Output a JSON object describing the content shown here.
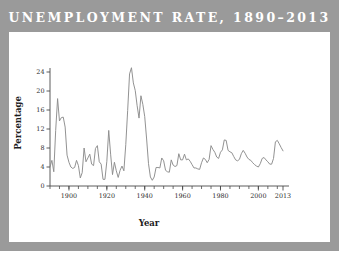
{
  "banner": {
    "title": "UNEMPLOYMENT RATE, 1890–2013",
    "background_color": "#9a9a9a",
    "title_color": "#ffffff"
  },
  "panel": {
    "background_color": "#ffffff"
  },
  "chart_data": {
    "type": "line",
    "title": "",
    "xlabel": "Year",
    "ylabel": "Percentage",
    "xlim": [
      1890,
      2013
    ],
    "ylim": [
      0,
      24
    ],
    "grid": false,
    "legend": null,
    "line_color": "#8c8c8c",
    "axis_color": "#4a4a4a",
    "yticks": [
      0,
      4,
      8,
      12,
      16,
      20,
      24
    ],
    "ytick_labels": [
      "0",
      "4",
      "8",
      "12",
      "16",
      "20",
      "24"
    ],
    "xticks": [
      1900,
      1920,
      1940,
      1960,
      1980,
      2000,
      2013
    ],
    "xtick_labels": [
      "1900",
      "1920",
      "1940",
      "1960",
      "1980",
      "2000",
      "2013"
    ],
    "xtick_minor_step": 5,
    "x": [
      1890,
      1891,
      1892,
      1893,
      1894,
      1895,
      1896,
      1897,
      1898,
      1899,
      1900,
      1901,
      1902,
      1903,
      1904,
      1905,
      1906,
      1907,
      1908,
      1909,
      1910,
      1911,
      1912,
      1913,
      1914,
      1915,
      1916,
      1917,
      1918,
      1919,
      1920,
      1921,
      1922,
      1923,
      1924,
      1925,
      1926,
      1927,
      1928,
      1929,
      1930,
      1931,
      1932,
      1933,
      1934,
      1935,
      1936,
      1937,
      1938,
      1939,
      1940,
      1941,
      1942,
      1943,
      1944,
      1945,
      1946,
      1947,
      1948,
      1949,
      1950,
      1951,
      1952,
      1953,
      1954,
      1955,
      1956,
      1957,
      1958,
      1959,
      1960,
      1961,
      1962,
      1963,
      1964,
      1965,
      1966,
      1967,
      1968,
      1969,
      1970,
      1971,
      1972,
      1973,
      1974,
      1975,
      1976,
      1977,
      1978,
      1979,
      1980,
      1981,
      1982,
      1983,
      1984,
      1985,
      1986,
      1987,
      1988,
      1989,
      1990,
      1991,
      1992,
      1993,
      1994,
      1995,
      1996,
      1997,
      1998,
      1999,
      2000,
      2001,
      2002,
      2003,
      2004,
      2005,
      2006,
      2007,
      2008,
      2009,
      2010,
      2011,
      2012,
      2013
    ],
    "values": [
      4.0,
      5.4,
      3.0,
      11.7,
      18.4,
      13.7,
      14.4,
      14.5,
      12.4,
      6.5,
      5.0,
      4.0,
      3.7,
      3.9,
      5.4,
      4.3,
      1.7,
      2.8,
      8.0,
      5.1,
      5.9,
      6.7,
      4.6,
      4.3,
      7.9,
      8.5,
      5.1,
      4.6,
      1.4,
      1.4,
      5.2,
      11.7,
      6.7,
      2.4,
      5.0,
      3.2,
      1.8,
      3.3,
      4.2,
      3.2,
      8.7,
      15.9,
      23.6,
      24.9,
      21.7,
      20.1,
      16.9,
      14.3,
      19.0,
      17.2,
      14.6,
      9.9,
      4.7,
      1.9,
      1.2,
      1.9,
      3.9,
      3.9,
      3.8,
      5.9,
      5.3,
      3.3,
      3.0,
      2.9,
      5.5,
      4.4,
      4.1,
      4.3,
      6.8,
      5.5,
      5.5,
      6.7,
      5.5,
      5.7,
      5.2,
      4.5,
      3.8,
      3.8,
      3.6,
      3.5,
      4.9,
      5.9,
      5.6,
      4.9,
      5.6,
      8.5,
      7.7,
      7.1,
      6.1,
      5.8,
      7.1,
      7.6,
      9.7,
      9.6,
      7.5,
      7.2,
      7.0,
      6.2,
      5.5,
      5.3,
      5.6,
      6.8,
      7.5,
      6.9,
      6.1,
      5.6,
      5.4,
      4.9,
      4.5,
      4.2,
      4.0,
      4.7,
      5.8,
      6.0,
      5.5,
      5.1,
      4.6,
      4.6,
      5.8,
      9.3,
      9.6,
      8.9,
      8.1,
      7.4
    ]
  }
}
